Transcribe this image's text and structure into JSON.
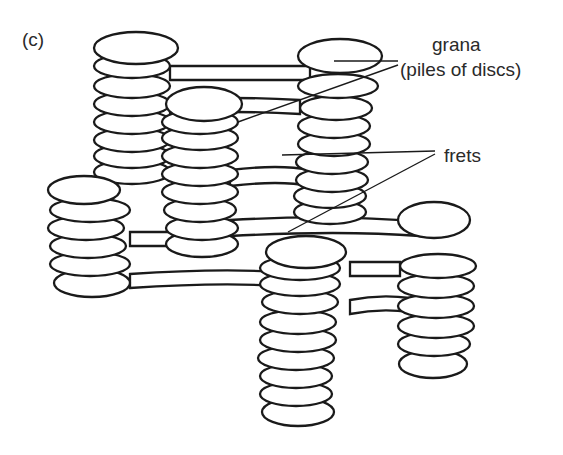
{
  "figure": {
    "panel_label": "(c)",
    "labels": {
      "grana_line1": "grana",
      "grana_line2": "(piles of discs)",
      "frets": "frets"
    },
    "stacks": [
      {
        "name": "back-left-stack",
        "discs": 8
      },
      {
        "name": "back-right-stack",
        "discs": 8
      },
      {
        "name": "middle-stack",
        "discs": 9
      },
      {
        "name": "left-stack",
        "discs": 6
      },
      {
        "name": "front-stack",
        "discs": 10
      },
      {
        "name": "right-stack",
        "discs": 6
      }
    ],
    "colors": {
      "ink": "#1a1a1a",
      "background": "#ffffff"
    }
  }
}
